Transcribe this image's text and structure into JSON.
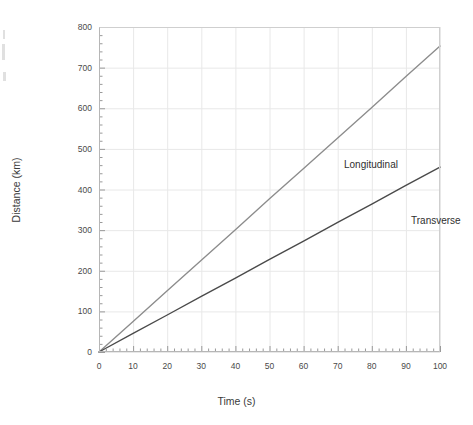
{
  "figure": {
    "background_color": "#ffffff",
    "frame_color": "#b6b6b6",
    "grid_color": "#e8e8e8"
  },
  "axes": {
    "x": {
      "title": "Time (s)",
      "min": 0,
      "max": 100,
      "major_step": 10,
      "minor_step": 2,
      "tick_labels": [
        "0",
        "10",
        "20",
        "30",
        "40",
        "50",
        "60",
        "70",
        "80",
        "90",
        "100"
      ]
    },
    "y": {
      "title": "Distance (km)",
      "min": 0,
      "max": 800,
      "major_step": 100,
      "minor_step": 20,
      "tick_labels": [
        "0",
        "100",
        "200",
        "300",
        "400",
        "500",
        "600",
        "700",
        "800"
      ]
    }
  },
  "annotations": {
    "longitudinal_label": "Longitudinal",
    "transverse_label": "Transverse"
  },
  "chart_data": {
    "type": "line",
    "title": "",
    "subtitle": "",
    "xlabel": "Time (s)",
    "ylabel": "Distance (km)",
    "xlim": [
      0,
      100
    ],
    "ylim": [
      0,
      800
    ],
    "x_major_step": 10,
    "y_major_step": 100,
    "grid": true,
    "legend": "inline-annotations",
    "x": [
      0,
      10,
      20,
      30,
      40,
      50,
      60,
      70,
      80,
      90,
      100
    ],
    "series": [
      {
        "name": "Longitudinal",
        "color": "#8c8c8c",
        "slope_km_per_s": 7.53,
        "values": [
          0,
          75,
          151,
          226,
          301,
          377,
          452,
          527,
          602,
          678,
          753
        ]
      },
      {
        "name": "Transverse",
        "color": "#4a4a4a",
        "slope_km_per_s": 4.55,
        "values": [
          0,
          46,
          91,
          137,
          182,
          228,
          273,
          319,
          364,
          410,
          455
        ]
      }
    ],
    "annotations": [
      {
        "text": "Longitudinal",
        "x": 48,
        "y": 520
      },
      {
        "text": "Transverse",
        "x": 68,
        "y": 385
      }
    ]
  }
}
